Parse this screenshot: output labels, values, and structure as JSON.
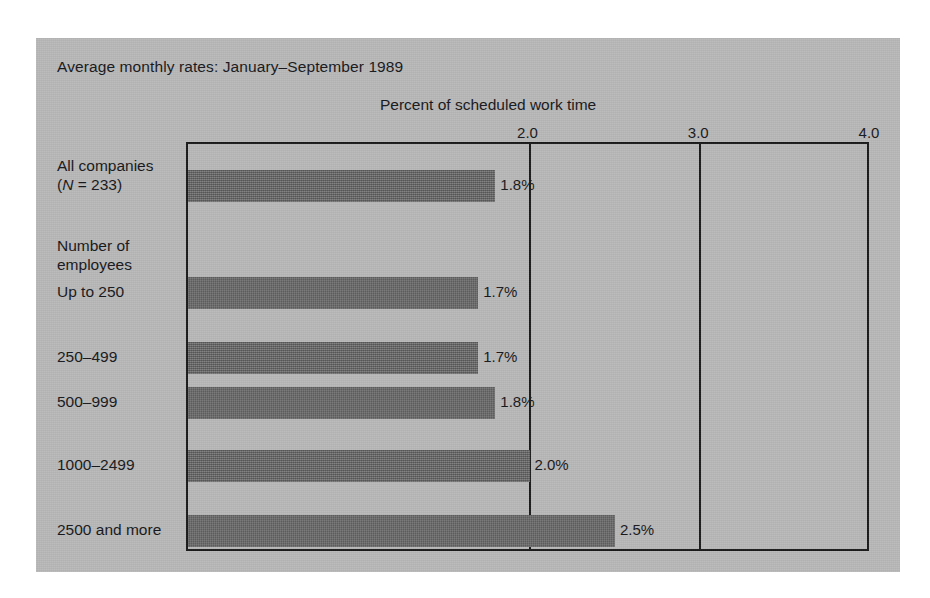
{
  "figure": {
    "title": "Average monthly rates: January–September 1989",
    "axis_title": "Percent of scheduled work time",
    "group_heading_line1": "Number of",
    "group_heading_line2": "employees",
    "all_companies_line1": "All companies",
    "all_companies_n_italic": "N",
    "all_companies_n_rest": " = 233)",
    "all_companies_paren_open": "(",
    "panel_color": "#b9b9b9",
    "bar_color": "#6a6a6a",
    "frame_color": "#1a1a1a",
    "text_color": "#16171a"
  },
  "chart_data": {
    "type": "bar",
    "orientation": "horizontal",
    "title": "Average monthly rates: January–September 1989",
    "subtitle": "Percent of scheduled work time",
    "xlabel": "Percent of scheduled work time",
    "ylabel": "Number of employees",
    "xlim": [
      0,
      4.0
    ],
    "xticks": [
      2.0,
      3.0,
      4.0
    ],
    "xtick_labels": [
      "2.0",
      "3.0",
      "4.0"
    ],
    "grid": true,
    "legend": false,
    "categories": [
      "All companies (N = 233)",
      "Up to 250",
      "250–499",
      "500–999",
      "1000–2499",
      "2500 and more"
    ],
    "values": [
      1.8,
      1.7,
      1.7,
      1.8,
      2.0,
      2.5
    ],
    "data_labels": [
      "1.8%",
      "1.7%",
      "1.7%",
      "1.8%",
      "2.0%",
      "2.5%"
    ]
  },
  "ticks": [
    {
      "label": "2.0",
      "value": 2.0
    },
    {
      "label": "3.0",
      "value": 3.0
    },
    {
      "label": "4.0",
      "value": 4.0
    }
  ],
  "bars": [
    {
      "label": "All companies",
      "sublabel": "(N = 233)",
      "value": 1.8,
      "data_label": "1.8%"
    },
    {
      "label": "Up to 250",
      "value": 1.7,
      "data_label": "1.7%"
    },
    {
      "label": "250–499",
      "value": 1.7,
      "data_label": "1.7%"
    },
    {
      "label": "500–999",
      "value": 1.8,
      "data_label": "1.8%"
    },
    {
      "label": "1000–2499",
      "value": 2.0,
      "data_label": "2.0%"
    },
    {
      "label": "2500 and more",
      "value": 2.5,
      "data_label": "2.5%"
    }
  ]
}
